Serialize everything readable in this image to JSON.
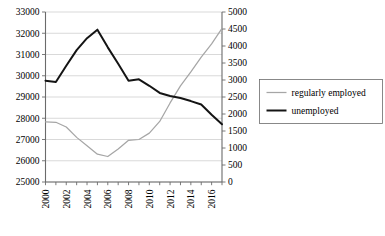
{
  "chart_data": {
    "type": "line",
    "title": "",
    "xlabel": "",
    "ylabel": "",
    "grid": true,
    "legend_position": "right",
    "x": [
      2000,
      2001,
      2002,
      2003,
      2004,
      2005,
      2006,
      2007,
      2008,
      2009,
      2010,
      2011,
      2012,
      2013,
      2014,
      2015,
      2016,
      2017
    ],
    "xtick_labels": [
      "2000",
      "2002",
      "2004",
      "2006",
      "2008",
      "2010",
      "2012",
      "2014",
      "2016"
    ],
    "xticks": [
      2000,
      2002,
      2004,
      2006,
      2008,
      2010,
      2012,
      2014,
      2016
    ],
    "xlim": [
      2000,
      2017
    ],
    "left_axis": {
      "ylim": [
        25000,
        33000
      ],
      "step": 1000,
      "tick_labels": [
        "33000",
        "32000",
        "31000",
        "30000",
        "29000",
        "28000",
        "27000",
        "26000",
        "25000"
      ],
      "ticks": [
        33000,
        32000,
        31000,
        30000,
        29000,
        28000,
        27000,
        26000,
        25000
      ]
    },
    "right_axis": {
      "ylim": [
        0,
        5000
      ],
      "step": 500,
      "tick_labels": [
        "5000",
        "4500",
        "4000",
        "3500",
        "3000",
        "2500",
        "2000",
        "1500",
        "1000",
        "500",
        "0"
      ],
      "ticks": [
        5000,
        4500,
        4000,
        3500,
        3000,
        2500,
        2000,
        1500,
        1000,
        500,
        0
      ]
    },
    "series": [
      {
        "name": "regularly employed",
        "axis": "left",
        "color": "#a6a6a6",
        "width": 1.25,
        "values": [
          27830,
          27810,
          27590,
          27100,
          26710,
          26310,
          26200,
          26550,
          26960,
          27000,
          27300,
          27850,
          28720,
          29520,
          30180,
          30880,
          31500,
          32230
        ]
      },
      {
        "name": "unemployed",
        "axis": "right",
        "color": "#141414",
        "width": 2.0,
        "values": [
          2980,
          2940,
          3420,
          3880,
          4230,
          4480,
          3960,
          3480,
          2980,
          3020,
          2830,
          2620,
          2530,
          2470,
          2380,
          2280,
          1980,
          1700
        ]
      }
    ],
    "legend": [
      {
        "label": "regularly employed",
        "color": "#a6a6a6",
        "width": 1.25
      },
      {
        "label": "unemployed",
        "color": "#141414",
        "width": 2.0
      }
    ]
  }
}
